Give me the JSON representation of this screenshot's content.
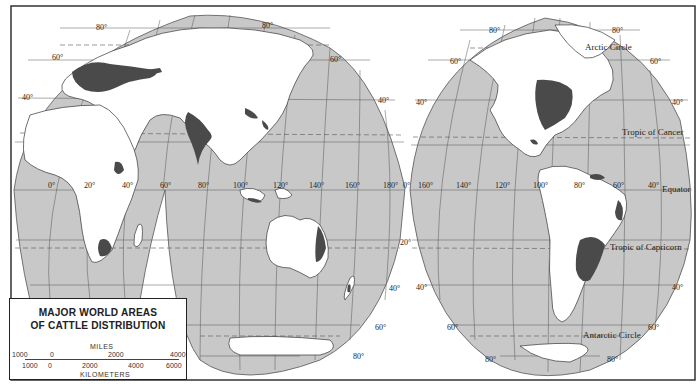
{
  "title_line1": "MAJOR WORLD AREAS",
  "title_line2": "OF CATTLE DISTRIBUTION",
  "scale": {
    "miles_label": "MILES",
    "miles_ticks": [
      "1000",
      "0",
      "2000",
      "4000"
    ],
    "km_label": "KILOMETERS",
    "km_ticks": [
      "1000",
      "0",
      "2000",
      "4000",
      "6000"
    ]
  },
  "reference_lines": {
    "arctic_circle": "Arctic Circle",
    "tropic_cancer": "Tropic of Cancer",
    "equator": "Equator",
    "tropic_capricorn": "Tropic of Capricorn",
    "antarctic_circle": "Antarctic Circle"
  },
  "latitude_labels": [
    "80°",
    "60°",
    "40°",
    "20°",
    "0°"
  ],
  "longitude_labels_east": [
    "0°",
    "20°",
    "40°",
    "60°",
    "80°",
    "100°",
    "120°",
    "140°",
    "160°",
    "180°"
  ],
  "longitude_labels_west": [
    "0°",
    "160°",
    "140°",
    "120°",
    "100°",
    "80°",
    "60°",
    "40°"
  ],
  "labels": {
    "lat80": "80°",
    "lat60": "60°",
    "lat40": "40°",
    "lat20": "20°",
    "lon0": "0°",
    "lon20": "20°",
    "lon40": "40°",
    "lon60": "60°",
    "lon80": "80°",
    "lon100": "100°",
    "lon120": "120°",
    "lon140": "140°",
    "lon160": "160°",
    "lon180": "180°"
  },
  "colors": {
    "ocean": "#c8c8c8",
    "land": "#ffffff",
    "cattle": "#4a4a4a",
    "grid": "#555555",
    "frame": "#333333"
  }
}
